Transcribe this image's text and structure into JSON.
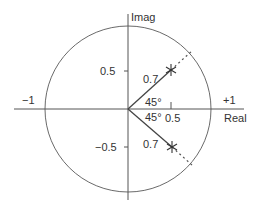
{
  "diagram": {
    "axes": {
      "x_label": "Real",
      "y_label": "Imag",
      "x_ticks": [
        {
          "value": -1,
          "label": "−1"
        },
        {
          "value": 0.5,
          "label": "0.5"
        },
        {
          "value": 1,
          "label": "+1"
        }
      ],
      "y_ticks": [
        {
          "value": 0.5,
          "label": "0.5"
        },
        {
          "value": -0.5,
          "label": "−0.5"
        }
      ]
    },
    "unit_circle": {
      "radius": 1
    },
    "poles": [
      {
        "magnitude": 0.7,
        "angle_deg": 45,
        "magnitude_label": "0.7",
        "angle_label": "45°",
        "marker": "asterisk"
      },
      {
        "magnitude": 0.7,
        "angle_deg": -45,
        "magnitude_label": "0.7",
        "angle_label": "45°",
        "marker": "asterisk"
      }
    ],
    "colors": {
      "line": "#555555",
      "text": "#333333",
      "background": "#ffffff"
    }
  }
}
